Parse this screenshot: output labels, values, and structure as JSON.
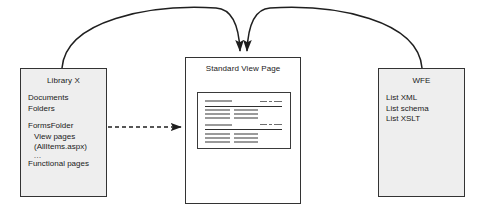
{
  "diagram": {
    "background": "#ffffff",
    "box_fill": "#eeeeee",
    "box_fill_center": "#ffffff",
    "stroke": "#333333"
  },
  "nodes": {
    "library": {
      "title": "Library X",
      "lines": [
        "Documents",
        "Folders",
        "FormsFolder",
        "View pages",
        "(AllItems.aspx)",
        "...",
        "Functional pages"
      ]
    },
    "view_page": {
      "title": "Standard View Page"
    },
    "wfe": {
      "title": "WFE",
      "lines": [
        "List XML",
        "List schema",
        "List XSLT"
      ]
    }
  },
  "connectors": {
    "library_to_viewpage_curve": {
      "name": "curved-arrow-library-to-view-page",
      "style": "solid-curve-arrow"
    },
    "wfe_to_viewpage_curve": {
      "name": "curved-arrow-wfe-to-view-page",
      "style": "solid-curve-arrow"
    },
    "library_to_viewpage_dashed": {
      "name": "dashed-arrow-library-to-view-page",
      "style": "dashed-straight-arrow"
    }
  }
}
